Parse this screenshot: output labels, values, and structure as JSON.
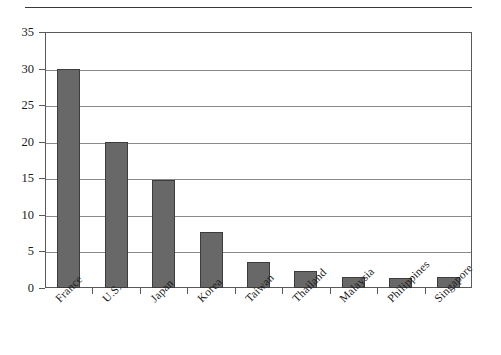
{
  "chart_data": {
    "type": "bar",
    "title": "",
    "subtitle": "",
    "xlabel": "",
    "ylabel": "",
    "categories": [
      "France",
      "U.S.",
      "Japan",
      "Korea",
      "Taiwan",
      "Thailand",
      "Malaysia",
      "Philippines",
      "Singapore"
    ],
    "values": [
      30.0,
      20.0,
      14.8,
      7.7,
      3.5,
      2.3,
      1.5,
      1.4,
      1.5
    ],
    "series": [
      {
        "name": "",
        "values": [
          30.0,
          20.0,
          14.8,
          7.7,
          3.5,
          2.3,
          1.5,
          1.4,
          1.5
        ]
      }
    ],
    "ylim": [
      0,
      35
    ],
    "xlim_categories": 9,
    "ytick_labels": [
      "0",
      "5",
      "10",
      "15",
      "20",
      "25",
      "30",
      "35"
    ],
    "ytick_values": [
      0,
      5,
      10,
      15,
      20,
      25,
      30,
      35
    ],
    "ytick_interval": 5,
    "grid": "horizontal",
    "legend": "none",
    "legend_position": "none",
    "annotations": [],
    "bar_color": "#686868",
    "bar_edge_color": "#3c3c3c",
    "grid_color": "#8a8a8a",
    "frame_color": "#595959",
    "background_color": "#ffffff",
    "text_color": "#1a1a1a",
    "xtick_label_rotation": -45
  },
  "decorations": {
    "top_rule_color": "#3a3a3a"
  }
}
